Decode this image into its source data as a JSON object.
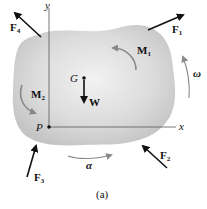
{
  "figure": {
    "caption": "(a)",
    "body_fill": "#d9d9d9",
    "arrow_color": "#111111",
    "rotation_arrow_color": "#888888",
    "axes": {
      "x_label": "x",
      "y_label": "y",
      "origin_label": "P"
    },
    "center_of_mass": {
      "label": "G"
    },
    "weight": {
      "label": "W"
    },
    "forces": [
      {
        "name": "F",
        "sub": "1"
      },
      {
        "name": "F",
        "sub": "2"
      },
      {
        "name": "F",
        "sub": "3"
      },
      {
        "name": "F",
        "sub": "4"
      }
    ],
    "moments": [
      {
        "name": "M",
        "sub": "1"
      },
      {
        "name": "M",
        "sub": "2"
      }
    ],
    "angular_velocity": {
      "label": "ω"
    },
    "angular_acceleration": {
      "label": "α"
    }
  }
}
